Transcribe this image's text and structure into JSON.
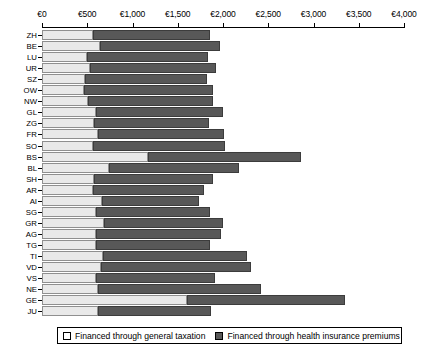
{
  "chart_data": {
    "type": "bar",
    "orientation": "horizontal",
    "stacked": true,
    "title": "",
    "xlabel": "",
    "ylabel": "",
    "xlim": [
      0,
      4000
    ],
    "xticks": [
      0,
      500,
      1000,
      1500,
      2000,
      2500,
      3000,
      3500,
      4000
    ],
    "xtick_labels": [
      "€0",
      "€500",
      "€1,000",
      "€1,500",
      "€2,000",
      "€2,500",
      "€3,000",
      "€3,500",
      "€4,000"
    ],
    "grid": false,
    "legend_position": "bottom",
    "categories": [
      "ZH",
      "BE",
      "LU",
      "UR",
      "SZ",
      "OW",
      "NW",
      "GL",
      "ZG",
      "FR",
      "SO",
      "BS",
      "BL",
      "SH",
      "AR",
      "AI",
      "SG",
      "GR",
      "AG",
      "TG",
      "TI",
      "VD",
      "VS",
      "NE",
      "GE",
      "JU"
    ],
    "series": [
      {
        "name": "Financed through general taxation",
        "color": "#e9e9e9",
        "values": [
          565,
          640,
          495,
          530,
          470,
          460,
          505,
          600,
          575,
          620,
          565,
          1170,
          740,
          570,
          565,
          665,
          600,
          690,
          600,
          600,
          675,
          655,
          600,
          620,
          1600,
          620
        ]
      },
      {
        "name": "Financed through health insurance premiums",
        "color": "#585858",
        "values": [
          1290,
          1325,
          1340,
          1390,
          1355,
          1425,
          1390,
          1400,
          1270,
          1390,
          1460,
          1690,
          1435,
          1325,
          1220,
          1070,
          1260,
          1310,
          1380,
          1255,
          1585,
          1650,
          1310,
          1800,
          1750,
          1245
        ]
      }
    ],
    "totals": [
      1855,
      1965,
      1835,
      1920,
      1825,
      1885,
      1895,
      2000,
      1845,
      2010,
      2025,
      2860,
      2175,
      1895,
      1785,
      1735,
      1860,
      2000,
      1980,
      1855,
      2260,
      2305,
      1910,
      2420,
      3350,
      1865
    ]
  },
  "legend": {
    "entries": [
      {
        "label": "Financed through general taxation",
        "style": "light"
      },
      {
        "label": "Financed through health insurance premiums",
        "style": "dark"
      }
    ]
  },
  "colors": {
    "light_fill": "#e9e9e9",
    "light_edge": "#8f8f8f",
    "dark_fill": "#585858",
    "dark_edge": "#3c3c3c",
    "axis": "#000000",
    "background": "#ffffff"
  }
}
